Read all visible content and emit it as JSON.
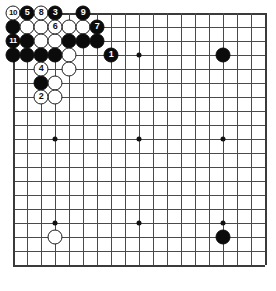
{
  "app": {
    "title": "Go board diagram",
    "board_size": 19
  },
  "board": {
    "colors": {
      "background": "#ffffff",
      "grid": "#4a4a4a",
      "edge": "#3a3a3a",
      "black_stone": "#0b0b0b",
      "white_stone": "#ffffff",
      "black_label": "#ffffff",
      "white_label": "#111111"
    },
    "star_points": [
      {
        "col": 3,
        "row": 3
      },
      {
        "col": 9,
        "row": 3
      },
      {
        "col": 15,
        "row": 3
      },
      {
        "col": 3,
        "row": 9
      },
      {
        "col": 9,
        "row": 9
      },
      {
        "col": 15,
        "row": 9
      },
      {
        "col": 3,
        "row": 15
      },
      {
        "col": 9,
        "row": 15
      },
      {
        "col": 15,
        "row": 15
      }
    ],
    "stones": [
      {
        "col": 0,
        "row": 0,
        "color": "white",
        "label": "10"
      },
      {
        "col": 1,
        "row": 0,
        "color": "black",
        "label": "5"
      },
      {
        "col": 2,
        "row": 0,
        "color": "white",
        "label": "8"
      },
      {
        "col": 3,
        "row": 0,
        "color": "black",
        "label": "3"
      },
      {
        "col": 5,
        "row": 0,
        "color": "black",
        "label": "9"
      },
      {
        "col": 0,
        "row": 1,
        "color": "black",
        "label": ""
      },
      {
        "col": 1,
        "row": 1,
        "color": "white",
        "label": ""
      },
      {
        "col": 2,
        "row": 1,
        "color": "white",
        "label": ""
      },
      {
        "col": 3,
        "row": 1,
        "color": "white",
        "label": "6"
      },
      {
        "col": 4,
        "row": 1,
        "color": "white",
        "label": ""
      },
      {
        "col": 5,
        "row": 1,
        "color": "white",
        "label": ""
      },
      {
        "col": 6,
        "row": 1,
        "color": "black",
        "label": "7"
      },
      {
        "col": 0,
        "row": 2,
        "color": "black",
        "label": "11"
      },
      {
        "col": 1,
        "row": 2,
        "color": "black",
        "label": ""
      },
      {
        "col": 2,
        "row": 2,
        "color": "white",
        "label": ""
      },
      {
        "col": 3,
        "row": 2,
        "color": "white",
        "label": ""
      },
      {
        "col": 4,
        "row": 2,
        "color": "black",
        "label": ""
      },
      {
        "col": 5,
        "row": 2,
        "color": "black",
        "label": ""
      },
      {
        "col": 6,
        "row": 2,
        "color": "black",
        "label": ""
      },
      {
        "col": 0,
        "row": 3,
        "color": "black",
        "label": ""
      },
      {
        "col": 1,
        "row": 3,
        "color": "black",
        "label": ""
      },
      {
        "col": 2,
        "row": 3,
        "color": "black",
        "label": ""
      },
      {
        "col": 3,
        "row": 3,
        "color": "black",
        "label": ""
      },
      {
        "col": 4,
        "row": 3,
        "color": "white",
        "label": ""
      },
      {
        "col": 7,
        "row": 3,
        "color": "black",
        "label": "1"
      },
      {
        "col": 15,
        "row": 3,
        "color": "black",
        "label": ""
      },
      {
        "col": 2,
        "row": 4,
        "color": "white",
        "label": "4"
      },
      {
        "col": 4,
        "row": 4,
        "color": "white",
        "label": ""
      },
      {
        "col": 2,
        "row": 5,
        "color": "black",
        "label": ""
      },
      {
        "col": 3,
        "row": 5,
        "color": "white",
        "label": ""
      },
      {
        "col": 2,
        "row": 6,
        "color": "white",
        "label": "2"
      },
      {
        "col": 3,
        "row": 6,
        "color": "white",
        "label": ""
      },
      {
        "col": 3,
        "row": 16,
        "color": "white",
        "label": ""
      },
      {
        "col": 15,
        "row": 16,
        "color": "black",
        "label": ""
      }
    ]
  }
}
